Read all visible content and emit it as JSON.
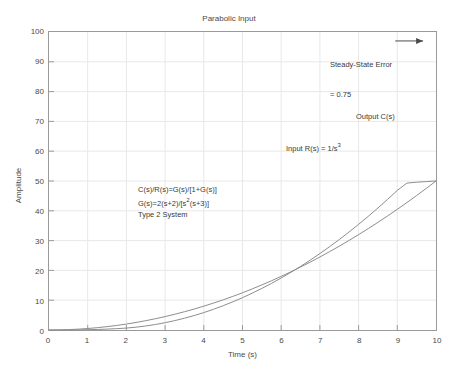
{
  "chart_data": {
    "type": "line",
    "title": "Parabolic Input\nUnity Feedback",
    "title_lines": [
      "Parabolic Input",
      "Unity Feedback"
    ],
    "xlabel": "Time (s)",
    "ylabel": "Amplitude",
    "xlim": [
      0,
      10
    ],
    "ylim": [
      0,
      100
    ],
    "xticks": [
      0,
      1,
      2,
      3,
      4,
      5,
      6,
      7,
      8,
      9,
      10
    ],
    "yticks": [
      0,
      10,
      20,
      30,
      40,
      50,
      60,
      70,
      80,
      90,
      100
    ],
    "grid": true,
    "legend_position": "inline-annotations",
    "series": [
      {
        "name": "Input R(s) = 1/s^3",
        "label": "Input R(s) = 1/s",
        "label_exponent": "3",
        "color": "#8c8c8c",
        "x": [
          0,
          0.25,
          0.5,
          0.75,
          1,
          1.25,
          1.5,
          1.75,
          2,
          2.25,
          2.5,
          2.75,
          3,
          3.25,
          3.5,
          3.75,
          4,
          4.25,
          4.5,
          4.75,
          5,
          5.25,
          5.5,
          5.75,
          6,
          6.25,
          6.5,
          6.75,
          7,
          7.25,
          7.5,
          7.75,
          8,
          8.25,
          8.5,
          8.75,
          9,
          9.25,
          9.5,
          9.75,
          10
        ],
        "values": [
          0,
          0.03,
          0.13,
          0.28,
          0.5,
          0.78,
          1.13,
          1.53,
          2,
          2.53,
          3.13,
          3.78,
          4.5,
          5.28,
          6.13,
          7.03,
          8,
          9.03,
          10.13,
          11.28,
          12.5,
          13.78,
          15.13,
          16.53,
          18,
          19.53,
          21.13,
          22.78,
          24.5,
          26.28,
          28.13,
          30.03,
          32,
          34.03,
          36.13,
          38.28,
          40.5,
          42.78,
          45.13,
          47.53,
          50
        ]
      },
      {
        "name": "Output C(s)",
        "label": "Output C(s)",
        "color": "#8c8c8c",
        "x": [
          0,
          0.25,
          0.5,
          0.75,
          1,
          1.25,
          1.5,
          1.75,
          2,
          2.25,
          2.5,
          2.75,
          3,
          3.25,
          3.5,
          3.75,
          4,
          4.25,
          4.5,
          4.75,
          5,
          5.25,
          5.5,
          5.75,
          6,
          6.25,
          6.5,
          6.75,
          7,
          7.25,
          7.5,
          7.75,
          8,
          8.25,
          8.5,
          8.75,
          9,
          9.25,
          9.5,
          9.75,
          10
        ],
        "values": [
          0,
          0.002,
          0.015,
          0.045,
          0.1,
          0.18,
          0.3,
          0.45,
          0.65,
          0.95,
          1.35,
          1.85,
          2.45,
          3.15,
          3.95,
          4.85,
          5.85,
          6.95,
          8.15,
          9.45,
          10.85,
          12.35,
          13.95,
          15.65,
          17.45,
          19.35,
          21.35,
          23.45,
          25.65,
          27.95,
          30.35,
          32.85,
          35.45,
          38.15,
          40.95,
          43.85,
          46.85,
          49.3,
          49.6,
          49.8,
          50
        ]
      }
    ],
    "annotations": [
      {
        "name": "steady-state-error",
        "text_lines": [
          "Steady-State Error",
          "= 0.75"
        ],
        "value": 0.75,
        "x": 7.3,
        "y": 95
      },
      {
        "name": "output-label",
        "text": "Output C(s)",
        "x": 8.3,
        "y": 72
      },
      {
        "name": "input-label",
        "text": "Input R(s) = 1/s",
        "exponent": "3",
        "x": 6.1,
        "y": 60
      }
    ],
    "equation_block": {
      "lines": [
        "C(s)/R(s)=G(s)/[1+G(s)]",
        "G(s)=2(s+2)/[s",
        "Type 2 System"
      ],
      "line1": "C(s)/R(s)=G(s)/[1+G(s)]",
      "line2_prefix": "G(s)=2(s+2)/[s",
      "line2_exponent": "2",
      "line2_suffix": "(s+3)]",
      "line3": "Type 2 System"
    }
  },
  "colors": {
    "curve": "#8c8c8c",
    "axis": "#9a9a9a",
    "grid": "#e8e8e8",
    "text": "#3a3a3a",
    "background": "#ffffff"
  }
}
